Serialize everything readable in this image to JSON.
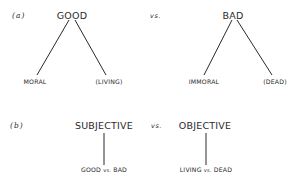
{
  "part_a": {
    "label": "(a)",
    "vs": "vs.",
    "left_tree": {
      "root": "GOOD",
      "children": [
        "MORAL",
        "(LIVING)"
      ]
    },
    "right_tree": {
      "root": "BAD",
      "children": [
        "IMMORAL",
        "(DEAD)"
      ]
    }
  },
  "part_b": {
    "label": "(b)",
    "vs": "vs.",
    "left": {
      "root": "SUBJECTIVE",
      "child_a": "GOOD",
      "child_vs": "vs.",
      "child_b": "BAD"
    },
    "right": {
      "root": "OBJECTIVE",
      "child_a": "LIVING",
      "child_vs": "vs.",
      "child_b": "DEAD"
    }
  },
  "colors": {
    "ink": "#2a2a2a",
    "background": "#ffffff"
  }
}
